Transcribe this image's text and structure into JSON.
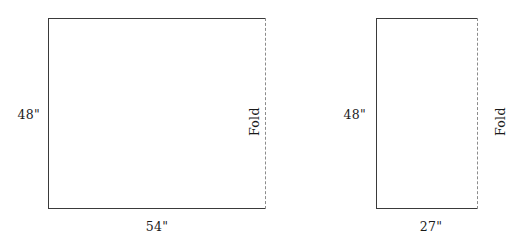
{
  "diagram": {
    "background_color": "#ffffff",
    "line_color": "#3a3a3a",
    "fold_line_color": "#8c8c8c",
    "text_color": "#1a1a1a",
    "figures": [
      {
        "id": "left-figure",
        "name": "wide-panel",
        "height_label": "48\"",
        "width_label": "54\"",
        "fold_label": "Fold",
        "fold_edge": "right",
        "fold_label_side": "inside",
        "rect": {
          "x": 48,
          "y": 18,
          "width": 218,
          "height": 191
        }
      },
      {
        "id": "right-figure",
        "name": "narrow-panel",
        "height_label": "48\"",
        "width_label": "27\"",
        "fold_label": "Fold",
        "fold_edge": "right",
        "fold_label_side": "outside",
        "rect": {
          "x": 376,
          "y": 18,
          "width": 102,
          "height": 191
        }
      }
    ]
  }
}
